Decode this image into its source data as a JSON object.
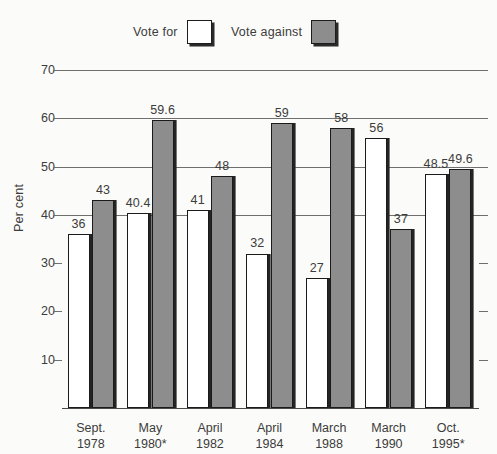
{
  "legend": {
    "items": [
      {
        "label": "Vote for",
        "swatch": "white",
        "color": "#ffffff"
      },
      {
        "label": "Vote against",
        "swatch": "gray",
        "color": "#8d8d8d"
      }
    ]
  },
  "axis": {
    "y_title": "Per cent",
    "y_ticks": [
      10,
      20,
      30,
      40,
      50,
      60,
      70
    ]
  },
  "chart_data": {
    "type": "bar",
    "title": "",
    "subtitle": "",
    "xlabel": "",
    "ylabel": "Per cent",
    "ylim": [
      0,
      70
    ],
    "grid": true,
    "legend_position": "top",
    "categories": [
      "Sept. 1978",
      "May 1980*",
      "April 1982",
      "April 1984",
      "March 1988",
      "March 1990",
      "Oct. 1995*"
    ],
    "category_lines": [
      [
        "Sept.",
        "1978"
      ],
      [
        "May",
        "1980*"
      ],
      [
        "April",
        "1982"
      ],
      [
        "April",
        "1984"
      ],
      [
        "March",
        "1988"
      ],
      [
        "March",
        "1990"
      ],
      [
        "Oct.",
        "1995*"
      ]
    ],
    "series": [
      {
        "name": "Vote for",
        "color": "#ffffff",
        "values": [
          36,
          40.4,
          41,
          32,
          27,
          56,
          48.5
        ],
        "labels": [
          "36",
          "40.4",
          "41",
          "32",
          "27",
          "56",
          "48.5"
        ]
      },
      {
        "name": "Vote against",
        "color": "#8d8d8d",
        "values": [
          43,
          59.6,
          48,
          59,
          58,
          37,
          49.6
        ],
        "labels": [
          "43",
          "59.6",
          "48",
          "59",
          "58",
          "37",
          "49.6"
        ]
      }
    ]
  }
}
